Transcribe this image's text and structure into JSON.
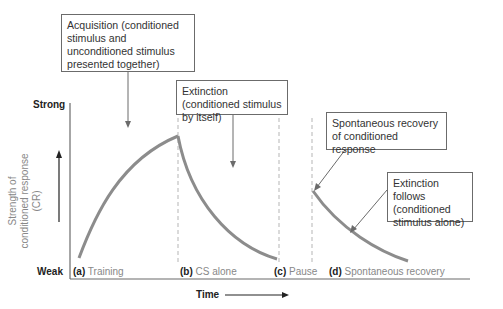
{
  "axes": {
    "y_top_label": "Strong",
    "y_bottom_label": "Weak",
    "y_title_line1": "Strength of",
    "y_title_line2": "conditioned response (CR)",
    "x_title": "Time"
  },
  "phases": [
    {
      "letter": "(a)",
      "label": "Training"
    },
    {
      "letter": "(b)",
      "label": "CS alone"
    },
    {
      "letter": "(c)",
      "label": "Pause"
    },
    {
      "letter": "(d)",
      "label": "Spontaneous recovery"
    }
  ],
  "callouts": {
    "acquisition": "Acquisition (conditioned stimulus and unconditioned stimulus presented together)",
    "extinction": "Extinction (conditioned stimulus by itself)",
    "spontaneous_recovery": "Spontaneous recovery of conditioned response",
    "extinction_follows": "Extinction follows (conditioned stimulus alone)"
  },
  "colors": {
    "curve": "#8c8c8c",
    "axis": "#6b6b6b",
    "dashed": "#b5b5b5",
    "text": "#333333"
  }
}
